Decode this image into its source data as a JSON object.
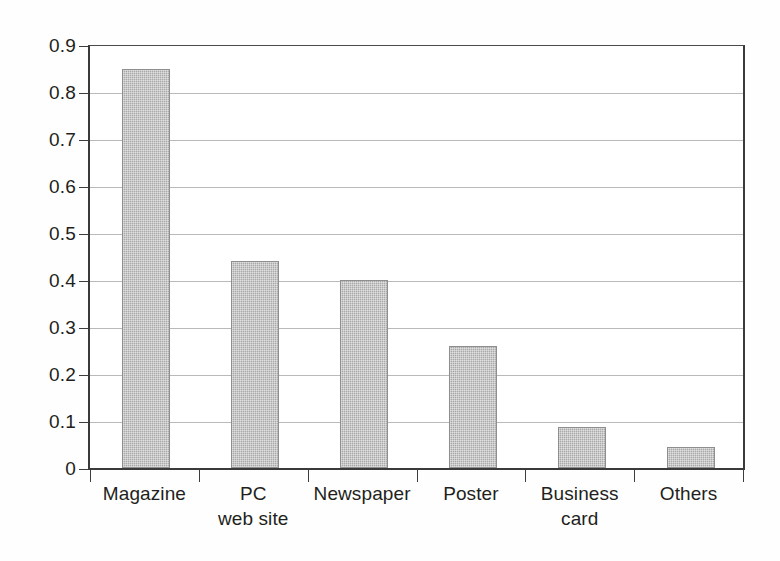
{
  "chart_data": {
    "type": "bar",
    "title": "",
    "subtitle": "",
    "xlabel": "",
    "ylabel": "",
    "categories": [
      "Magazine",
      "PC\nweb site",
      "Newspaper",
      "Poster",
      "Business\ncard",
      "Others"
    ],
    "values": [
      0.85,
      0.44,
      0.4,
      0.26,
      0.087,
      0.045
    ],
    "ylim": [
      0,
      0.9
    ],
    "ytick_values": [
      0,
      0.1,
      0.2,
      0.3,
      0.4,
      0.5,
      0.6,
      0.7,
      0.8,
      0.9
    ],
    "ytick_labels": [
      "0",
      "0.1",
      "0.2",
      "0.3",
      "0.4",
      "0.5",
      "0.6",
      "0.7",
      "0.8",
      "0.9"
    ],
    "grid": true,
    "legend": null,
    "legend_position": "none",
    "series": [
      {
        "name": "Share",
        "values": [
          0.85,
          0.44,
          0.4,
          0.26,
          0.087,
          0.045
        ]
      }
    ],
    "colors": {
      "bar_fill": "#a9a9a9",
      "bar_edge": "#8e8e8e",
      "axis": "#3a3a3a",
      "gridline": "#b9b9b9",
      "text": "#231f20",
      "background": "#fefefe"
    }
  }
}
